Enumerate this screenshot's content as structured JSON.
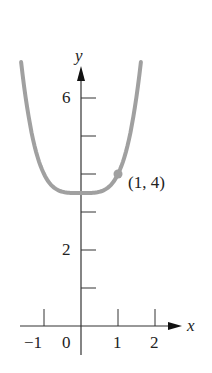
{
  "chart_data": {
    "type": "line",
    "title": "",
    "xlabel": "x",
    "ylabel": "y",
    "x_ticks": [
      -1,
      0,
      1,
      2
    ],
    "x_tick_labels": [
      "−1",
      "0",
      "1",
      "2"
    ],
    "y_ticks": [
      1,
      2,
      3,
      4,
      5,
      6
    ],
    "y_tick_labels": {
      "2": "2",
      "6": "6"
    },
    "xlim": [
      -1.7,
      2.5
    ],
    "ylim": [
      0,
      7.2
    ],
    "grid": false,
    "series": [
      {
        "name": "curve",
        "color": "#a0a0a0",
        "x": [
          -1.6,
          -1.4,
          -1.2,
          -1.0,
          -0.8,
          -0.6,
          -0.4,
          -0.2,
          0.0,
          0.2,
          0.4,
          0.6,
          0.8,
          1.0,
          1.2,
          1.4,
          1.6
        ],
        "y": [
          6.78,
          5.42,
          4.54,
          4.0,
          3.7,
          3.56,
          3.51,
          3.5,
          3.5,
          3.5,
          3.51,
          3.56,
          3.7,
          4.0,
          4.54,
          5.42,
          6.78
        ]
      }
    ],
    "annotations": [
      {
        "text": "(1, 4)",
        "x": 1,
        "y": 4,
        "marker": "point"
      }
    ]
  }
}
